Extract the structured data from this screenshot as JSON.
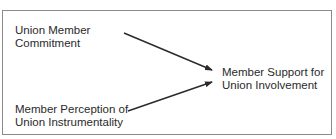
{
  "diagram": {
    "nodes": [
      {
        "id": "commitment",
        "line1": "Union Member",
        "line2": "Commitment"
      },
      {
        "id": "perception",
        "line1": "Member Perception of",
        "line2": "Union Instrumentality"
      },
      {
        "id": "support",
        "line1": "Member Support for",
        "line2": "Union Involvement"
      }
    ],
    "edges": [
      {
        "from": "commitment",
        "to": "support"
      },
      {
        "from": "perception",
        "to": "support"
      }
    ],
    "colors": {
      "border": "#8a8a8a",
      "text": "#2a2a2a",
      "arrow": "#2a2a2a"
    }
  }
}
